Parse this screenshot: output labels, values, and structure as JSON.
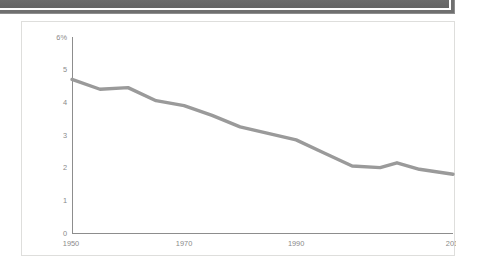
{
  "window": {
    "toolbar_name": "cropped-dark-toolbar"
  },
  "chart_panel": {
    "border_color": "#dededc",
    "background_color": "#ffffff"
  },
  "chart_data": {
    "type": "line",
    "title": "",
    "subtitle": "",
    "xlabel": "",
    "ylabel": "",
    "grid": false,
    "legend": "none",
    "line_color": "#9a9a9a",
    "axis_color": "#8d8d8d",
    "tick_text_color": "#8a8a8a",
    "xlim": [
      1950,
      2018
    ],
    "ylim": [
      0,
      6
    ],
    "ytick_labels": [
      "6%",
      "5",
      "4",
      "3",
      "2",
      "1",
      "0"
    ],
    "ytick_values": [
      6,
      5,
      4,
      3,
      2,
      1,
      0
    ],
    "xtick_labels": [
      "1950",
      "1970",
      "1990",
      "2018"
    ],
    "xtick_values": [
      1950,
      1970,
      1990,
      2018
    ],
    "x": [
      1950,
      1955,
      1960,
      1965,
      1970,
      1975,
      1980,
      1985,
      1990,
      1995,
      2000,
      2005,
      2008,
      2012,
      2018
    ],
    "values": [
      4.7,
      4.4,
      4.45,
      4.05,
      3.9,
      3.6,
      3.25,
      3.05,
      2.85,
      2.45,
      2.05,
      2.0,
      2.15,
      1.95,
      1.8
    ],
    "series": [
      {
        "name": "rate",
        "values": [
          4.7,
          4.4,
          4.45,
          4.05,
          3.9,
          3.6,
          3.25,
          3.05,
          2.85,
          2.45,
          2.05,
          2.0,
          2.15,
          1.95,
          1.8
        ]
      }
    ]
  }
}
